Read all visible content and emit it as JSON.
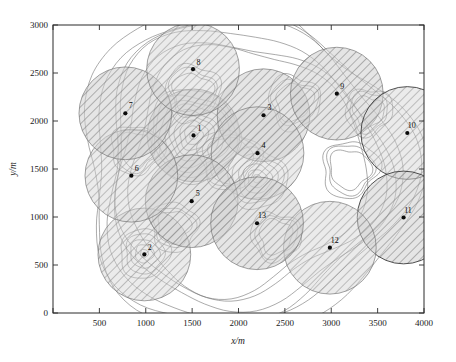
{
  "chart_data": {
    "type": "scatter",
    "title": "",
    "subtitle": "",
    "xlabel": "x/m",
    "ylabel": "y/m",
    "xlim": [
      0,
      4000
    ],
    "ylim": [
      0,
      3000
    ],
    "xticks": [
      0,
      500,
      1000,
      1500,
      2000,
      2500,
      3000,
      3500,
      4000
    ],
    "xticklabels": [
      "",
      "500",
      "1000",
      "1500",
      "2000",
      "2500",
      "3000",
      "3500",
      "4000"
    ],
    "yticks": [
      0,
      500,
      1000,
      1500,
      2000,
      2500,
      3000
    ],
    "yticklabels": [
      "0",
      "500",
      "1000",
      "1500",
      "2000",
      "2500",
      "3000"
    ],
    "grid": false,
    "legend": "none",
    "units": "m",
    "marker": "filled-circle",
    "coverage_radius": 500,
    "series": [
      {
        "name": "nodes",
        "points": [
          {
            "label": "1",
            "x": 1515,
            "y": 1850,
            "r": 500,
            "label_dx": 11,
            "label_dy": -8
          },
          {
            "label": "2",
            "x": 985,
            "y": 610,
            "r": 500,
            "label_dx": 10,
            "label_dy": -8
          },
          {
            "label": "3",
            "x": 2270,
            "y": 2060,
            "r": 500,
            "label_dx": 11,
            "label_dy": -9
          },
          {
            "label": "4",
            "x": 2205,
            "y": 1665,
            "r": 500,
            "label_dx": 11,
            "label_dy": -9
          },
          {
            "label": "5",
            "x": 1495,
            "y": 1165,
            "r": 500,
            "label_dx": 11,
            "label_dy": -9
          },
          {
            "label": "6",
            "x": 845,
            "y": 1430,
            "r": 500,
            "label_dx": 10,
            "label_dy": -9
          },
          {
            "label": "7",
            "x": 780,
            "y": 2080,
            "r": 500,
            "label_dx": 10,
            "label_dy": -9
          },
          {
            "label": "8",
            "x": 1510,
            "y": 2540,
            "r": 500,
            "label_dx": 10,
            "label_dy": -8
          },
          {
            "label": "9",
            "x": 3060,
            "y": 2285,
            "r": 500,
            "label_dx": 10,
            "label_dy": -9
          },
          {
            "label": "10",
            "x": 3820,
            "y": 1875,
            "r": 500,
            "label_dx": 8,
            "label_dy": -9
          },
          {
            "label": "11",
            "x": 3780,
            "y": 995,
            "r": 500,
            "label_dx": 8,
            "label_dy": -9
          },
          {
            "label": "12",
            "x": 2985,
            "y": 680,
            "r": 500,
            "label_dx": 9,
            "label_dy": -9
          },
          {
            "label": "13",
            "x": 2200,
            "y": 935,
            "r": 500,
            "label_dx": 9,
            "label_dy": -9
          }
        ]
      }
    ],
    "contours": {
      "description": "terrain/field contour lines underlying the coverage disks",
      "peaks": [
        {
          "cx": 1515,
          "cy": 1850,
          "levels": 9
        },
        {
          "cx": 2200,
          "cy": 1400,
          "levels": 6
        },
        {
          "cx": 985,
          "cy": 620,
          "levels": 5
        }
      ]
    },
    "colors": {
      "axis": "#2b2b2b",
      "marker": "#0a0a0a",
      "disk_fill": "#b9b9b9",
      "disk_stroke": "#6e6e6e",
      "disk_stroke_dark": "#333333",
      "contour": "#6b6b6b",
      "background": "#ffffff"
    }
  }
}
